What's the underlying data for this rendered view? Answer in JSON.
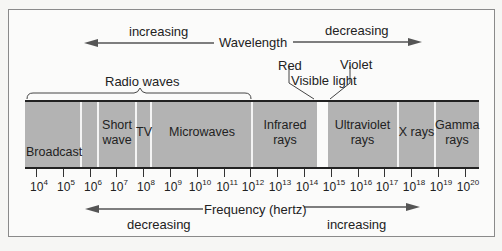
{
  "wavelength": {
    "title": "Wavelength",
    "left_label": "increasing",
    "right_label": "decreasing"
  },
  "frequency": {
    "title": "Frequency (hertz)",
    "left_label": "decreasing",
    "right_label": "increasing"
  },
  "brackets": {
    "radio": "Radio waves",
    "visible": "Visible light",
    "red": "Red",
    "violet": "Violet"
  },
  "bands": {
    "broadcast": "Broadcast",
    "shortwave_1": "Short",
    "shortwave_2": "wave",
    "tv": "TV",
    "microwaves": "Microwaves",
    "infrared_1": "Infrared",
    "infrared_2": "rays",
    "ultraviolet_1": "Ultraviolet",
    "ultraviolet_2": "rays",
    "xrays": "X rays",
    "gamma_1": "Gamma",
    "gamma_2": "rays"
  },
  "ticks": [
    {
      "base": "10",
      "exp": "4"
    },
    {
      "base": "10",
      "exp": "5"
    },
    {
      "base": "10",
      "exp": "6"
    },
    {
      "base": "10",
      "exp": "7"
    },
    {
      "base": "10",
      "exp": "8"
    },
    {
      "base": "10",
      "exp": "9"
    },
    {
      "base": "10",
      "exp": "10"
    },
    {
      "base": "10",
      "exp": "11"
    },
    {
      "base": "10",
      "exp": "12"
    },
    {
      "base": "10",
      "exp": "13"
    },
    {
      "base": "10",
      "exp": "14"
    },
    {
      "base": "10",
      "exp": "15"
    },
    {
      "base": "10",
      "exp": "16"
    },
    {
      "base": "10",
      "exp": "17"
    },
    {
      "base": "10",
      "exp": "18"
    },
    {
      "base": "10",
      "exp": "19"
    },
    {
      "base": "10",
      "exp": "20"
    }
  ],
  "colors": {
    "band": "#b3b3b3",
    "divider": "#f4f4f4",
    "line": "#222222",
    "arrow": "#555555"
  }
}
